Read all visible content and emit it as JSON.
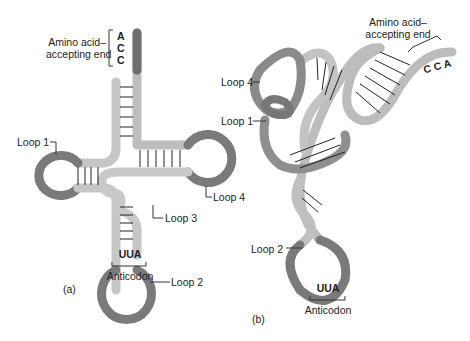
{
  "panel_a": {
    "caption": "(a)",
    "amino_label_line1": "Amino acid–",
    "amino_label_line2": "accepting end",
    "acceptor_bases": [
      "A",
      "C",
      "C"
    ],
    "loops": [
      "Loop 1",
      "Loop 2",
      "Loop 3",
      "Loop 4"
    ],
    "anticodon_seq": "UUA",
    "anticodon_label": "Anticodon"
  },
  "panel_b": {
    "caption": "(b)",
    "amino_label_line1": "Amino acid–",
    "amino_label_line2": "accepting end",
    "acceptor_bases": [
      "C",
      "C",
      "A"
    ],
    "loops": [
      "Loop 4",
      "Loop 1",
      "Loop 2"
    ],
    "anticodon_seq": "UUA",
    "anticodon_label": "Anticodon"
  },
  "colors": {
    "light_strand": "#c8c8c8",
    "dark_strand": "#7a7a7a",
    "outline": "#5a5a5a",
    "bond": "#222222"
  }
}
